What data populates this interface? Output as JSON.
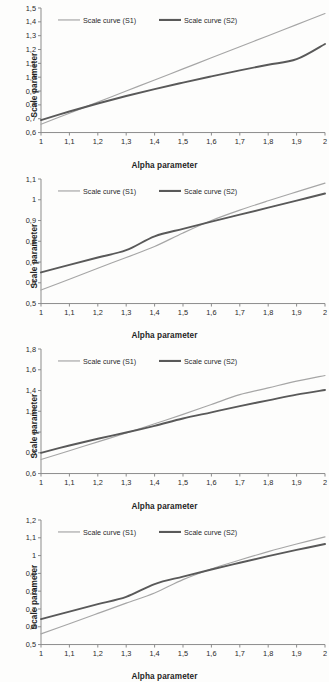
{
  "figure": {
    "background_color": "#fdfdfc",
    "series_colors": {
      "s1": "#a6a6a6",
      "s2": "#595959"
    },
    "axis_color": "#8c8c8c"
  },
  "legend": {
    "s1_label": "Scale curve (S1)",
    "s2_label": "Scale curve (S2)"
  },
  "labels": {
    "ylabel": "Scale parameter",
    "xlabel": "Alpha parameter"
  },
  "chart_data": [
    {
      "type": "line",
      "title": "",
      "xlabel": "Alpha parameter",
      "ylabel": "Scale parameter",
      "xlim": [
        1,
        2
      ],
      "ylim": [
        0.6,
        1.5
      ],
      "xticks": [
        1,
        1.1,
        1.2,
        1.3,
        1.4,
        1.5,
        1.6,
        1.7,
        1.8,
        1.9,
        2
      ],
      "xticklabels": [
        "1",
        "1,1",
        "1,2",
        "1,3",
        "1,4",
        "1,5",
        "1,6",
        "1,7",
        "1,8",
        "1,9",
        "2"
      ],
      "yticks": [
        0.6,
        0.7,
        0.8,
        0.9,
        1.0,
        1.1,
        1.2,
        1.3,
        1.4,
        1.5
      ],
      "yticklabels": [
        "0,6",
        "0,7",
        "0,8",
        "0,9",
        "1,0",
        "1,1",
        "1,2",
        "1,3",
        "1,4",
        "1,5"
      ],
      "grid": false,
      "legend_position": "top-left-inside",
      "x": [
        1,
        1.1,
        1.2,
        1.3,
        1.4,
        1.5,
        1.6,
        1.7,
        1.8,
        1.9,
        2
      ],
      "series": [
        {
          "name": "Scale curve (S1)",
          "values": [
            0.66,
            0.74,
            0.82,
            0.9,
            0.98,
            1.06,
            1.14,
            1.22,
            1.3,
            1.38,
            1.46
          ]
        },
        {
          "name": "Scale curve (S2)",
          "values": [
            0.69,
            0.752,
            0.81,
            0.864,
            0.914,
            0.961,
            1.006,
            1.049,
            1.09,
            1.13,
            1.24
          ]
        }
      ]
    },
    {
      "type": "line",
      "title": "",
      "xlabel": "Alpha parameter",
      "ylabel": "Scale parameter",
      "xlim": [
        1,
        2
      ],
      "ylim": [
        0.5,
        1.1
      ],
      "xticks": [
        1,
        1.1,
        1.2,
        1.3,
        1.4,
        1.5,
        1.6,
        1.7,
        1.8,
        1.9,
        2
      ],
      "xticklabels": [
        "1",
        "1,1",
        "1,2",
        "1,3",
        "1,4",
        "1,5",
        "1,6",
        "1,7",
        "1,8",
        "1,9",
        "2"
      ],
      "yticks": [
        0.5,
        0.6,
        0.7,
        0.8,
        0.9,
        1.0,
        1.1
      ],
      "yticklabels": [
        "0,5",
        "0,6",
        "0,7",
        "0,8",
        "0,9",
        "1",
        "1,1"
      ],
      "grid": false,
      "legend_position": "top-left-inside",
      "x": [
        1,
        1.1,
        1.2,
        1.3,
        1.4,
        1.5,
        1.6,
        1.7,
        1.8,
        1.9,
        2
      ],
      "series": [
        {
          "name": "Scale curve (S1)",
          "values": [
            0.565,
            0.617,
            0.67,
            0.722,
            0.775,
            0.84,
            0.9,
            0.95,
            0.995,
            1.038,
            1.08
          ]
        },
        {
          "name": "Scale curve (S2)",
          "values": [
            0.65,
            0.686,
            0.722,
            0.757,
            0.824,
            0.86,
            0.895,
            0.928,
            0.962,
            0.996,
            1.03
          ]
        }
      ]
    },
    {
      "type": "line",
      "title": "",
      "xlabel": "Alpha parameter",
      "ylabel": "Scale parameter",
      "xlim": [
        1,
        2
      ],
      "ylim": [
        0.6,
        1.8
      ],
      "xticks": [
        1,
        1.1,
        1.2,
        1.3,
        1.4,
        1.5,
        1.6,
        1.7,
        1.8,
        1.9,
        2
      ],
      "xticklabels": [
        "1",
        "1,1",
        "1,2",
        "1,3",
        "1,4",
        "1,5",
        "1,6",
        "1,7",
        "1,8",
        "1,9",
        "2"
      ],
      "yticks": [
        0.6,
        0.8,
        1.0,
        1.2,
        1.4,
        1.6,
        1.8
      ],
      "yticklabels": [
        "0,6",
        "0,8",
        "1",
        "1,2",
        "1,4",
        "1,6",
        "1,8"
      ],
      "grid": false,
      "legend_position": "top-left-inside",
      "x": [
        1,
        1.1,
        1.2,
        1.3,
        1.4,
        1.5,
        1.6,
        1.7,
        1.8,
        1.9,
        2
      ],
      "series": [
        {
          "name": "Scale curve (S1)",
          "values": [
            0.735,
            0.82,
            0.905,
            0.99,
            1.08,
            1.17,
            1.265,
            1.36,
            1.425,
            1.49,
            1.545
          ]
        },
        {
          "name": "Scale curve (S2)",
          "values": [
            0.8,
            0.87,
            0.935,
            0.995,
            1.06,
            1.13,
            1.19,
            1.25,
            1.305,
            1.36,
            1.405
          ]
        }
      ]
    },
    {
      "type": "line",
      "title": "",
      "xlabel": "Alpha parameter",
      "ylabel": "Scale parameter",
      "xlim": [
        1,
        2
      ],
      "ylim": [
        0.5,
        1.2
      ],
      "xticks": [
        1,
        1.1,
        1.2,
        1.3,
        1.4,
        1.5,
        1.6,
        1.7,
        1.8,
        1.9,
        2
      ],
      "xticklabels": [
        "1",
        "1,1",
        "1,2",
        "1,3",
        "1,4",
        "1,5",
        "1,6",
        "1,7",
        "1,8",
        "1,9",
        "2"
      ],
      "yticks": [
        0.5,
        0.6,
        0.7,
        0.8,
        0.9,
        1.0,
        1.1,
        1.2
      ],
      "yticklabels": [
        "0,5",
        "0,6",
        "0,7",
        "0,8",
        "0,9",
        "1",
        "1,1",
        "1,2"
      ],
      "grid": false,
      "legend_position": "top-left-inside",
      "x": [
        1,
        1.1,
        1.2,
        1.3,
        1.4,
        1.5,
        1.6,
        1.7,
        1.8,
        1.9,
        2
      ],
      "series": [
        {
          "name": "Scale curve (S1)",
          "values": [
            0.56,
            0.617,
            0.675,
            0.733,
            0.79,
            0.865,
            0.925,
            0.975,
            1.022,
            1.065,
            1.105
          ]
        },
        {
          "name": "Scale curve (S2)",
          "values": [
            0.643,
            0.685,
            0.727,
            0.768,
            0.84,
            0.882,
            0.922,
            0.96,
            0.997,
            1.032,
            1.065
          ]
        }
      ]
    }
  ]
}
